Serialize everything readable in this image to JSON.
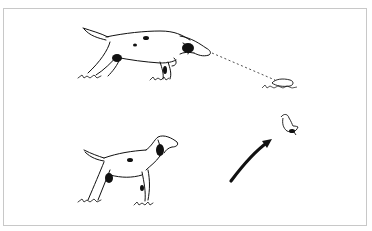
{
  "illustration": {
    "description": "Line drawing of a setter dog pointing at a bird hidden in grass, then standing alert as the bird flushes",
    "panels": [
      {
        "label": "dog-pointing",
        "subject": "setter pointing low toward bird in grass",
        "element": "dotted line of sight"
      },
      {
        "label": "bird-flushing",
        "subject": "setter standing alert",
        "element": "curved arrow toward flying bird"
      }
    ],
    "colors": {
      "ink": "#111111",
      "frame": "#c8c8c8",
      "background": "#ffffff"
    }
  }
}
